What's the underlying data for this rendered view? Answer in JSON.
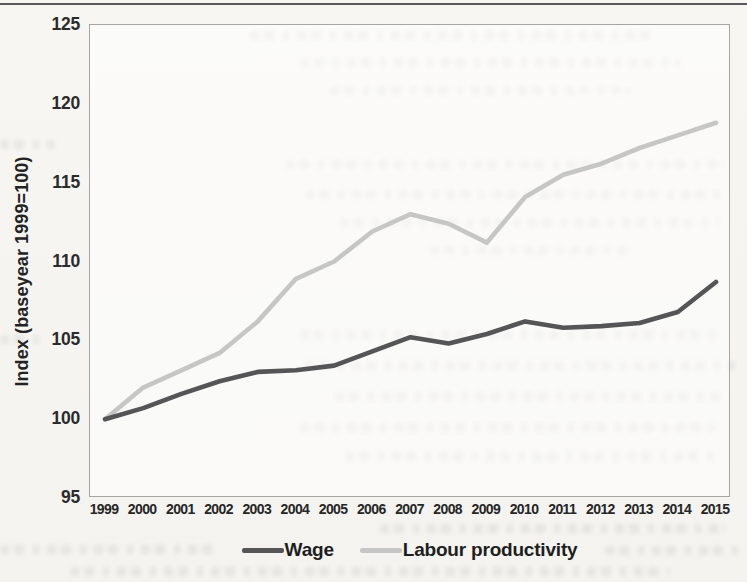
{
  "chart_data": {
    "type": "line",
    "title": "",
    "xlabel": "",
    "ylabel": "Index (baseyear 1999=100)",
    "ylim": [
      95,
      125
    ],
    "yticks": [
      95,
      100,
      105,
      110,
      115,
      120,
      125
    ],
    "categories": [
      "1999",
      "2000",
      "2001",
      "2002",
      "2003",
      "2004",
      "2005",
      "2006",
      "2007",
      "2008",
      "2009",
      "2010",
      "2011",
      "2012",
      "2013",
      "2014",
      "2015"
    ],
    "series": [
      {
        "name": "Wage",
        "color": "#555557",
        "values": [
          100,
          100.7,
          101.6,
          102.4,
          103.0,
          103.1,
          103.4,
          104.3,
          105.2,
          104.8,
          105.4,
          106.2,
          105.8,
          105.9,
          106.1,
          106.8,
          108.7
        ]
      },
      {
        "name": "Labour productivity",
        "color": "#c6c6c6",
        "values": [
          100,
          102.0,
          103.1,
          104.2,
          106.2,
          108.9,
          110.0,
          111.9,
          113.0,
          112.4,
          111.2,
          114.1,
          115.5,
          116.2,
          117.2,
          118.0,
          118.8
        ]
      }
    ],
    "grid": false,
    "legend_position": "bottom"
  }
}
